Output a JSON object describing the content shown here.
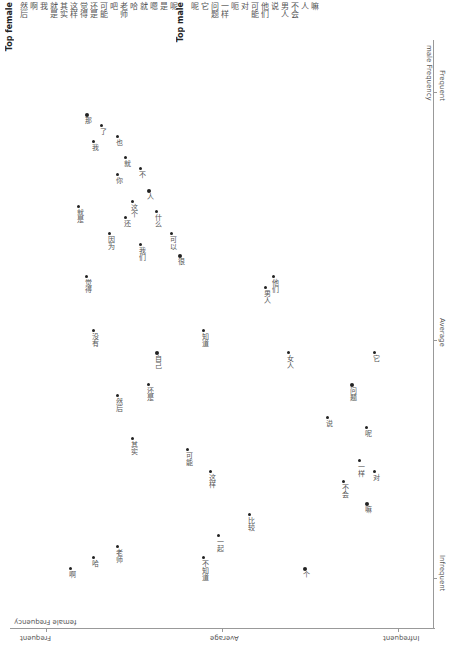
{
  "chart_data": {
    "type": "scatter",
    "title": "",
    "orientation_note": "figure rendered rotated 90 degrees",
    "xlabel": "female Frequency",
    "ylabel": "male Frequency",
    "x_ticks": [
      "Frequent",
      "Average",
      "Infrequent"
    ],
    "y_ticks": [
      "Frequent",
      "Average",
      "Infrequent"
    ],
    "legend": {
      "top_female_title": "Top female",
      "top_female": [
        "然后",
        "啊",
        "我",
        "就是",
        "其实",
        "这样",
        "觉得",
        "还是",
        "可能",
        "吧",
        "老师",
        "哈",
        "就",
        "嗯",
        "是",
        "呢"
      ],
      "top_male_title": "Top male",
      "top_male": [
        "呢",
        "它",
        "问题",
        "一样",
        "呃",
        "对",
        "可能",
        "他们",
        "说",
        "男人",
        "不会",
        "人",
        "嘛"
      ]
    },
    "points": [
      {
        "label": "那",
        "x": 14,
        "y": 8
      },
      {
        "label": "了",
        "x": 18,
        "y": 10
      },
      {
        "label": "我",
        "x": 16,
        "y": 13
      },
      {
        "label": "也",
        "x": 22,
        "y": 12
      },
      {
        "label": "就",
        "x": 24,
        "y": 16
      },
      {
        "label": "你",
        "x": 22,
        "y": 19
      },
      {
        "label": "不",
        "x": 28,
        "y": 18
      },
      {
        "label": "人",
        "x": 30,
        "y": 22
      },
      {
        "label": "这个",
        "x": 26,
        "y": 24
      },
      {
        "label": "还",
        "x": 24,
        "y": 27
      },
      {
        "label": "什么",
        "x": 32,
        "y": 26
      },
      {
        "label": "因为",
        "x": 20,
        "y": 30
      },
      {
        "label": "我们",
        "x": 28,
        "y": 32
      },
      {
        "label": "可以",
        "x": 36,
        "y": 30
      },
      {
        "label": "很",
        "x": 38,
        "y": 34
      },
      {
        "label": "就是",
        "x": 12,
        "y": 25
      },
      {
        "label": "觉得",
        "x": 14,
        "y": 38
      },
      {
        "label": "没有",
        "x": 16,
        "y": 48
      },
      {
        "label": "然后",
        "x": 22,
        "y": 60
      },
      {
        "label": "其实",
        "x": 26,
        "y": 68
      },
      {
        "label": "还是",
        "x": 30,
        "y": 58
      },
      {
        "label": "自己",
        "x": 32,
        "y": 52
      },
      {
        "label": "可能",
        "x": 40,
        "y": 70
      },
      {
        "label": "这样",
        "x": 46,
        "y": 74
      },
      {
        "label": "知道",
        "x": 44,
        "y": 48
      },
      {
        "label": "他们",
        "x": 62,
        "y": 38
      },
      {
        "label": "男人",
        "x": 60,
        "y": 40
      },
      {
        "label": "女人",
        "x": 66,
        "y": 52
      },
      {
        "label": "问题",
        "x": 82,
        "y": 58
      },
      {
        "label": "它",
        "x": 88,
        "y": 52
      },
      {
        "label": "呢",
        "x": 86,
        "y": 66
      },
      {
        "label": "一样",
        "x": 84,
        "y": 72
      },
      {
        "label": "对",
        "x": 88,
        "y": 74
      },
      {
        "label": "说",
        "x": 76,
        "y": 64
      },
      {
        "label": "不会",
        "x": 80,
        "y": 76
      },
      {
        "label": "嘛",
        "x": 86,
        "y": 80
      },
      {
        "label": "啊",
        "x": 10,
        "y": 92
      },
      {
        "label": "哈",
        "x": 16,
        "y": 90
      },
      {
        "label": "老师",
        "x": 22,
        "y": 88
      },
      {
        "label": "一起",
        "x": 48,
        "y": 86
      },
      {
        "label": "比较",
        "x": 56,
        "y": 82
      },
      {
        "label": "不知道",
        "x": 44,
        "y": 90
      },
      {
        "label": "个",
        "x": 70,
        "y": 92
      }
    ],
    "grid": false
  }
}
